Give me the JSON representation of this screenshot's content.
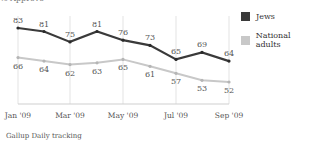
{
  "subtitle": "% Approve",
  "source": "Gallup Daily tracking",
  "legend": [
    {
      "label": "Jews",
      "color": "#3a3a3a"
    },
    {
      "label": "National adults",
      "color": "#c8c8c8"
    }
  ],
  "x_tick_labels": [
    "Jan '09",
    "Mar '09",
    "May '09",
    "Jul '09",
    "Sep '09"
  ],
  "chart_data": {
    "type": "line",
    "title": "",
    "subtitle": "% Approve",
    "xlabel": "",
    "ylabel": "% Approve",
    "x": [
      "Jan '09",
      "Feb '09",
      "Mar '09",
      "Apr '09",
      "May '09",
      "Jun '09",
      "Jul '09",
      "Aug '09",
      "Sep '09"
    ],
    "x_ticks": [
      "Jan '09",
      "Mar '09",
      "May '09",
      "Jul '09",
      "Sep '09"
    ],
    "series": [
      {
        "name": "Jews",
        "color": "#3a3a3a",
        "values": [
          83,
          81,
          75,
          81,
          76,
          73,
          65,
          69,
          64
        ]
      },
      {
        "name": "National adults",
        "color": "#c8c8c8",
        "values": [
          66,
          64,
          62,
          63,
          65,
          61,
          57,
          53,
          52
        ]
      }
    ],
    "data_labels": true,
    "grid": "vertical lines at labeled months",
    "legend_position": "right",
    "source": "Gallup Daily tracking"
  }
}
